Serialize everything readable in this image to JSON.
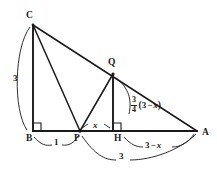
{
  "figure": {
    "kind": "geometry-diagram",
    "stroke_color": "#1a1a1a",
    "background_color": "#ffffff",
    "vertices": [
      {
        "name": "C",
        "label": "C",
        "x": 33,
        "y": 25,
        "label_x": 27,
        "label_y": 12
      },
      {
        "name": "B",
        "label": "B",
        "x": 33,
        "y": 131,
        "label_x": 27,
        "label_y": 136
      },
      {
        "name": "P",
        "label": "P",
        "x": 80,
        "y": 131,
        "label_x": 74,
        "label_y": 136
      },
      {
        "name": "H",
        "label": "H",
        "x": 122,
        "y": 131,
        "label_x": 116,
        "label_y": 136
      },
      {
        "name": "A",
        "label": "A",
        "x": 197,
        "y": 131,
        "label_x": 203,
        "label_y": 130
      },
      {
        "name": "Q",
        "label": "Q",
        "x": 113,
        "y": 74,
        "label_x": 109,
        "label_y": 60
      }
    ],
    "segments": [
      {
        "name": "segment-CB",
        "from": "C",
        "to": "B"
      },
      {
        "name": "segment-CP",
        "from": "C",
        "to": "P"
      },
      {
        "name": "segment-CA",
        "from": "C",
        "to": "A"
      },
      {
        "name": "segment-QP",
        "from": "Q",
        "to": "P"
      },
      {
        "name": "segment-QH",
        "from": "Q",
        "to": "H"
      },
      {
        "name": "segment-BA",
        "from": "B",
        "to": "A"
      }
    ],
    "right_angles": [
      {
        "name": "right-angle-B",
        "at": "B"
      },
      {
        "name": "right-angle-H",
        "at": "H"
      }
    ],
    "measures": {
      "cb_length": "3",
      "bp_length": "1",
      "ph_length": "x",
      "ha_length_a": "3",
      "ha_length_op": "−",
      "ha_length_b": "x",
      "pa_length": "3",
      "qh_num": "3",
      "qh_den": "4",
      "qh_paren_open": "(",
      "qh_inner_a": "3",
      "qh_inner_op": "−",
      "qh_inner_b": "x",
      "qh_paren_close": ")"
    }
  }
}
